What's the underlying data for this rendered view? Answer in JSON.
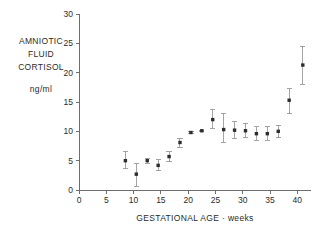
{
  "chart_data": {
    "type": "scatter",
    "title": "",
    "subtitle": "",
    "xlabel": "GESTATIONAL AGE · weeks",
    "ylabel_lines": [
      "AMNIOTIC",
      "FLUID",
      "CORTISOL"
    ],
    "ylabel_units": "ng/ml",
    "xlim": [
      0,
      42.5
    ],
    "ylim": [
      0,
      30
    ],
    "xticks": [
      0,
      5,
      10,
      15,
      20,
      25,
      30,
      35,
      40
    ],
    "yticks": [
      0,
      5,
      10,
      15,
      20,
      25,
      30
    ],
    "xtick_labels": [
      "0",
      "5",
      "10",
      "15",
      "20",
      "25",
      "30",
      "35",
      "40"
    ],
    "ytick_labels": [
      "0",
      "5",
      "10",
      "15",
      "20",
      "25",
      "30"
    ],
    "grid": false,
    "legend": null,
    "marker_color": "#2d2d2d",
    "errorbar_color": "#9a9a9a",
    "axis_color": "#6e6e6e",
    "background_color": "#ffffff",
    "series": [
      {
        "name": "Amniotic fluid cortisol",
        "x": [
          8.5,
          10.5,
          12.5,
          14.5,
          16.5,
          18.5,
          20.5,
          22.5,
          24.5,
          26.5,
          28.5,
          30.5,
          32.5,
          34.5,
          36.5,
          38.5,
          41.0
        ],
        "y": [
          5.0,
          2.7,
          5.0,
          4.2,
          5.7,
          8.1,
          9.8,
          10.1,
          12.0,
          10.3,
          10.2,
          10.1,
          9.6,
          9.6,
          10.0,
          15.3,
          21.3
        ],
        "yerr_low": [
          3.6,
          0.6,
          4.6,
          3.3,
          4.8,
          7.2,
          9.6,
          10.0,
          10.5,
          8.1,
          8.7,
          8.9,
          8.5,
          8.5,
          8.9,
          13.0,
          18.0
        ],
        "yerr_high": [
          6.5,
          4.6,
          5.4,
          5.2,
          6.5,
          8.8,
          10.0,
          10.2,
          13.8,
          13.1,
          11.7,
          11.4,
          10.8,
          10.9,
          11.0,
          17.3,
          24.5
        ]
      }
    ]
  },
  "geometry": {
    "plot_left_px": 79,
    "plot_right_px": 311,
    "plot_top_px": 14,
    "plot_bottom_px": 190
  }
}
